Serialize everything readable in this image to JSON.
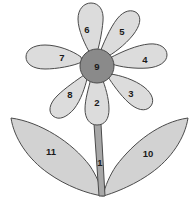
{
  "diagram": {
    "background_color": "#ffffff",
    "outline_color": "#4a4a4a",
    "label_color": "#1a1a1a",
    "colors": {
      "petal_fill": "#dcdcdc",
      "center_fill": "#8a8a8a",
      "leaf_fill": "#d2d2d2",
      "stem_fill": "#a8a8a8"
    },
    "parts": {
      "stem": {
        "label": "1",
        "name": "stem",
        "fill": "#a8a8a8",
        "label_x": 100,
        "label_y": 162
      },
      "center": {
        "label": "9",
        "name": "flower-center",
        "fill": "#8a8a8a",
        "label_x": 97,
        "label_y": 66
      },
      "petals": [
        {
          "label": "2",
          "name": "petal-bottom",
          "label_x": 97,
          "label_y": 102
        },
        {
          "label": "3",
          "name": "petal-bottom-right",
          "label_x": 131,
          "label_y": 93
        },
        {
          "label": "4",
          "name": "petal-right",
          "label_x": 145,
          "label_y": 59
        },
        {
          "label": "5",
          "name": "petal-top-right",
          "label_x": 122,
          "label_y": 31
        },
        {
          "label": "6",
          "name": "petal-top",
          "label_x": 87,
          "label_y": 29
        },
        {
          "label": "7",
          "name": "petal-left",
          "label_x": 62,
          "label_y": 57
        },
        {
          "label": "8",
          "name": "petal-bottom-left",
          "label_x": 70,
          "label_y": 94
        }
      ],
      "leaves": [
        {
          "label": "10",
          "name": "leaf-right",
          "label_x": 148,
          "label_y": 153
        },
        {
          "label": "11",
          "name": "leaf-left",
          "label_x": 51,
          "label_y": 151
        }
      ]
    }
  }
}
